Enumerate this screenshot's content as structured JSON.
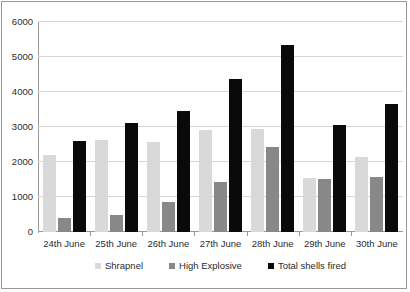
{
  "chart_data": {
    "type": "bar",
    "title": "",
    "subtitle": "",
    "xlabel": "",
    "ylabel": "",
    "ylim": [
      0,
      6000
    ],
    "ytick_values": [
      0,
      1000,
      2000,
      3000,
      4000,
      5000,
      6000
    ],
    "ytick_labels": [
      "0",
      "1000",
      "2000",
      "3000",
      "4000",
      "5000",
      "6000"
    ],
    "grid": true,
    "legend_position": "bottom",
    "categories": [
      "24th June",
      "25th June",
      "26th June",
      "27th June",
      "28th June",
      "29th June",
      "30th June"
    ],
    "series": [
      {
        "name": "Shrapnel",
        "color": "#d9d9d9",
        "values": [
          2200,
          2620,
          2580,
          2920,
          2930,
          1550,
          2140
        ]
      },
      {
        "name": "High Explosive",
        "color": "#888888",
        "values": [
          400,
          490,
          870,
          1440,
          2440,
          1520,
          1570
        ]
      },
      {
        "name": "Total shells fired",
        "color": "#0a0a0a",
        "values": [
          2600,
          3120,
          3450,
          4360,
          5340,
          3050,
          3660
        ]
      }
    ]
  },
  "colors": {
    "axis": "#9a9a9a",
    "gridline": "#d6d6d6",
    "text": "#2b2b2b",
    "background": "#ffffff",
    "border": "#9a9a9a"
  }
}
